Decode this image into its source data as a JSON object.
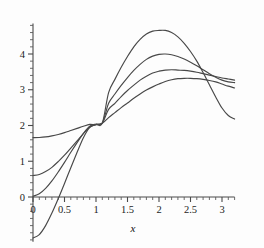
{
  "chart_data": {
    "type": "line",
    "title": "",
    "subtitle": "",
    "xlabel": "x",
    "ylabel": "",
    "xlim": [
      0,
      3.2
    ],
    "ylim": [
      -1.25,
      4.85
    ],
    "grid": false,
    "legend": "none",
    "x_ticks": [
      0,
      0.5,
      1,
      1.5,
      2,
      2.5,
      3
    ],
    "x_tick_labels": [
      "0",
      "0.5",
      "1",
      "1.5",
      "2",
      "2.5",
      "3"
    ],
    "x_minor_step": 0.1,
    "y_ticks": [
      0,
      1,
      2,
      3,
      4
    ],
    "y_tick_labels": [
      "0",
      "1",
      "2",
      "3",
      "4"
    ],
    "y_minor_step": 0.2,
    "common_crossing": {
      "x": 1.12,
      "y": 2.07
    },
    "series": [
      {
        "name": "curve-1-flattest",
        "start_value": 1.66,
        "peak": {
          "x": 2.45,
          "y": 3.32
        },
        "end_value": 3.05,
        "points_x": [
          0,
          0.1,
          0.2,
          0.3,
          0.4,
          0.5,
          0.6,
          0.7,
          0.8,
          0.9,
          1.0,
          1.1,
          1.2,
          1.3,
          1.4,
          1.5,
          1.6,
          1.7,
          1.8,
          1.9,
          2.0,
          2.1,
          2.2,
          2.3,
          2.4,
          2.5,
          2.6,
          2.7,
          2.8,
          2.9,
          3.0,
          3.1,
          3.2
        ],
        "points_y": [
          1.66,
          1.665,
          1.68,
          1.71,
          1.75,
          1.8,
          1.86,
          1.92,
          1.98,
          2.03,
          2.02,
          2.06,
          2.22,
          2.36,
          2.5,
          2.63,
          2.76,
          2.88,
          2.99,
          3.08,
          3.16,
          3.23,
          3.28,
          3.31,
          3.32,
          3.32,
          3.31,
          3.29,
          3.26,
          3.22,
          3.16,
          3.1,
          3.05
        ]
      },
      {
        "name": "curve-2-low-amplitude",
        "start_value": 0.6,
        "peak": {
          "x": 2.22,
          "y": 3.56
        },
        "end_value": 3.27,
        "points_x": [
          0,
          0.1,
          0.2,
          0.3,
          0.4,
          0.5,
          0.6,
          0.7,
          0.8,
          0.9,
          1.0,
          1.1,
          1.2,
          1.3,
          1.4,
          1.5,
          1.6,
          1.7,
          1.8,
          1.9,
          2.0,
          2.1,
          2.2,
          2.3,
          2.4,
          2.5,
          2.6,
          2.7,
          2.8,
          2.9,
          3.0,
          3.1,
          3.2
        ],
        "points_y": [
          0.6,
          0.63,
          0.71,
          0.83,
          0.99,
          1.17,
          1.37,
          1.57,
          1.77,
          1.95,
          2.03,
          2.07,
          2.45,
          2.62,
          2.81,
          2.98,
          3.13,
          3.27,
          3.38,
          3.47,
          3.52,
          3.55,
          3.56,
          3.55,
          3.54,
          3.52,
          3.49,
          3.45,
          3.41,
          3.37,
          3.33,
          3.3,
          3.27
        ]
      },
      {
        "name": "curve-3-mid-amplitude",
        "start_value": 0.02,
        "peak": {
          "x": 2.12,
          "y": 4.0
        },
        "end_value": 3.2,
        "points_x": [
          0,
          0.1,
          0.2,
          0.3,
          0.4,
          0.5,
          0.6,
          0.7,
          0.8,
          0.9,
          1.0,
          1.1,
          1.2,
          1.3,
          1.4,
          1.5,
          1.6,
          1.7,
          1.8,
          1.9,
          2.0,
          2.1,
          2.2,
          2.3,
          2.4,
          2.5,
          2.6,
          2.7,
          2.8,
          2.9,
          3.0,
          3.1,
          3.2
        ],
        "points_y": [
          0.02,
          0.09,
          0.24,
          0.45,
          0.7,
          0.97,
          1.25,
          1.52,
          1.78,
          1.98,
          2.04,
          2.07,
          2.62,
          2.88,
          3.12,
          3.34,
          3.54,
          3.71,
          3.85,
          3.94,
          3.99,
          4.0,
          3.98,
          3.93,
          3.86,
          3.77,
          3.67,
          3.56,
          3.45,
          3.35,
          3.27,
          3.22,
          3.2
        ]
      },
      {
        "name": "curve-4-high-amplitude",
        "start_value": -1.15,
        "zero_crossing_x": 0.46,
        "peak": {
          "x": 2.07,
          "y": 4.66
        },
        "end_value": 2.18,
        "points_x": [
          0,
          0.1,
          0.2,
          0.3,
          0.4,
          0.5,
          0.6,
          0.7,
          0.8,
          0.9,
          1.0,
          1.1,
          1.2,
          1.3,
          1.4,
          1.5,
          1.6,
          1.7,
          1.8,
          1.9,
          2.0,
          2.1,
          2.2,
          2.3,
          2.4,
          2.5,
          2.6,
          2.7,
          2.8,
          2.9,
          3.0,
          3.1,
          3.2
        ],
        "points_y": [
          -1.15,
          -1.05,
          -0.8,
          -0.45,
          -0.05,
          0.38,
          0.82,
          1.25,
          1.66,
          1.95,
          2.03,
          2.07,
          2.92,
          3.29,
          3.63,
          3.93,
          4.2,
          4.41,
          4.56,
          4.64,
          4.66,
          4.66,
          4.6,
          4.48,
          4.3,
          4.07,
          3.8,
          3.48,
          3.14,
          2.8,
          2.49,
          2.28,
          2.18
        ]
      }
    ]
  },
  "axis_title": {
    "x": "x"
  }
}
